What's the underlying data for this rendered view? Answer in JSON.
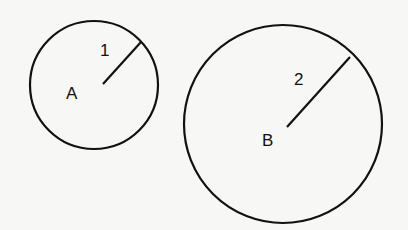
{
  "diagram": {
    "background": "#f7f7f5",
    "stroke_color": "#111111",
    "circles": [
      {
        "name": "A",
        "center_label": "A",
        "radius_label": "1",
        "cx": 94,
        "cy": 85,
        "r": 64,
        "radius_line": {
          "x1": 103,
          "y1": 84,
          "x2": 141,
          "y2": 42
        },
        "label_pos": {
          "x": 66,
          "y": 99
        },
        "radius_label_pos": {
          "x": 100,
          "y": 56
        }
      },
      {
        "name": "B",
        "center_label": "B",
        "radius_label": "2",
        "cx": 283,
        "cy": 124,
        "r": 99,
        "radius_line": {
          "x1": 287,
          "y1": 127,
          "x2": 350,
          "y2": 57
        },
        "label_pos": {
          "x": 262,
          "y": 146
        },
        "radius_label_pos": {
          "x": 294,
          "y": 85
        }
      }
    ]
  }
}
